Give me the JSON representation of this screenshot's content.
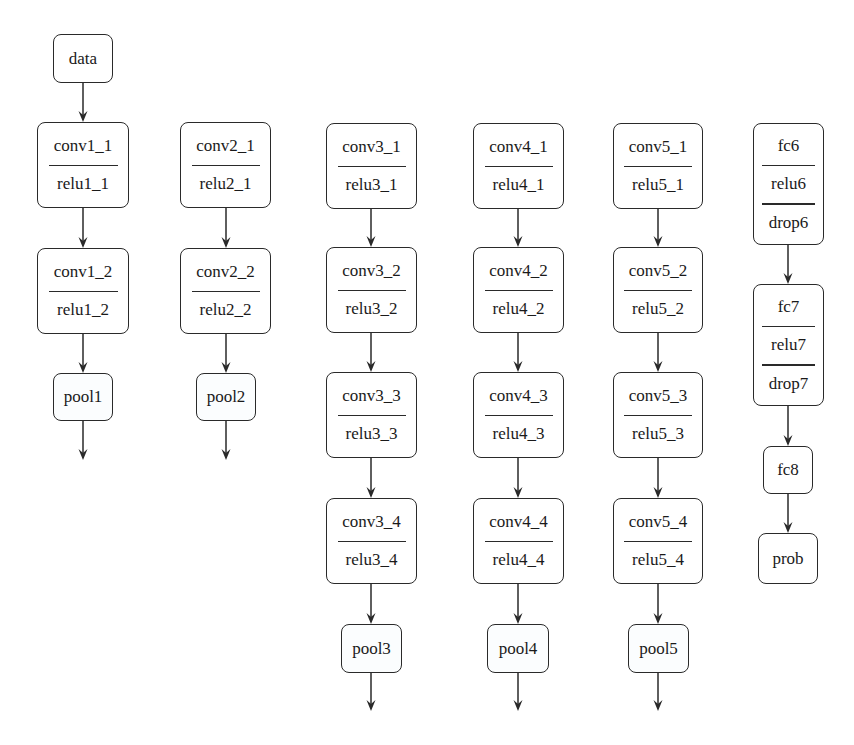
{
  "diagram": {
    "type": "network-architecture",
    "colors": {
      "stroke": "#2a2a2a",
      "background": "#ffffff",
      "text": "#1a1a1a"
    },
    "nodes": [
      {
        "id": "data",
        "parts": [
          "data"
        ],
        "box": [
          53,
          34,
          60,
          49
        ]
      },
      {
        "id": "conv1_1",
        "parts": [
          "conv1_1",
          "relu1_1"
        ],
        "box": [
          37,
          122,
          92,
          86
        ]
      },
      {
        "id": "conv1_2",
        "parts": [
          "conv1_2",
          "relu1_2"
        ],
        "box": [
          37,
          248,
          92,
          86
        ]
      },
      {
        "id": "pool1",
        "parts": [
          "pool1"
        ],
        "box": [
          53,
          373,
          60,
          48
        ],
        "pool": true
      },
      {
        "id": "conv2_1",
        "parts": [
          "conv2_1",
          "relu2_1"
        ],
        "box": [
          180,
          122,
          91,
          86
        ]
      },
      {
        "id": "conv2_2",
        "parts": [
          "conv2_2",
          "relu2_2"
        ],
        "box": [
          180,
          248,
          91,
          86
        ]
      },
      {
        "id": "pool2",
        "parts": [
          "pool2"
        ],
        "box": [
          196,
          373,
          60,
          48
        ],
        "pool": true
      },
      {
        "id": "conv3_1",
        "parts": [
          "conv3_1",
          "relu3_1"
        ],
        "box": [
          326,
          123,
          91,
          86
        ]
      },
      {
        "id": "conv3_2",
        "parts": [
          "conv3_2",
          "relu3_2"
        ],
        "box": [
          326,
          247,
          91,
          86
        ]
      },
      {
        "id": "conv3_3",
        "parts": [
          "conv3_3",
          "relu3_3"
        ],
        "box": [
          326,
          372,
          91,
          86
        ]
      },
      {
        "id": "conv3_4",
        "parts": [
          "conv3_4",
          "relu3_4"
        ],
        "box": [
          326,
          498,
          91,
          86
        ]
      },
      {
        "id": "pool3",
        "parts": [
          "pool3"
        ],
        "box": [
          341,
          624,
          61,
          49
        ],
        "pool": true
      },
      {
        "id": "conv4_1",
        "parts": [
          "conv4_1",
          "relu4_1"
        ],
        "box": [
          473,
          123,
          91,
          86
        ]
      },
      {
        "id": "conv4_2",
        "parts": [
          "conv4_2",
          "relu4_2"
        ],
        "box": [
          473,
          247,
          91,
          86
        ]
      },
      {
        "id": "conv4_3",
        "parts": [
          "conv4_3",
          "relu4_3"
        ],
        "box": [
          473,
          372,
          91,
          86
        ]
      },
      {
        "id": "conv4_4",
        "parts": [
          "conv4_4",
          "relu4_4"
        ],
        "box": [
          473,
          498,
          91,
          86
        ]
      },
      {
        "id": "pool4",
        "parts": [
          "pool4"
        ],
        "box": [
          487,
          624,
          62,
          49
        ],
        "pool": true
      },
      {
        "id": "conv5_1",
        "parts": [
          "conv5_1",
          "relu5_1"
        ],
        "box": [
          613,
          123,
          90,
          86
        ]
      },
      {
        "id": "conv5_2",
        "parts": [
          "conv5_2",
          "relu5_2"
        ],
        "box": [
          613,
          247,
          90,
          86
        ]
      },
      {
        "id": "conv5_3",
        "parts": [
          "conv5_3",
          "relu5_3"
        ],
        "box": [
          613,
          372,
          90,
          86
        ]
      },
      {
        "id": "conv5_4",
        "parts": [
          "conv5_4",
          "relu5_4"
        ],
        "box": [
          613,
          498,
          90,
          86
        ]
      },
      {
        "id": "pool5",
        "parts": [
          "pool5"
        ],
        "box": [
          628,
          624,
          61,
          49
        ],
        "pool": true
      },
      {
        "id": "fc6",
        "parts": [
          "fc6",
          "relu6",
          "drop6"
        ],
        "box": [
          753,
          123,
          71,
          122
        ]
      },
      {
        "id": "fc7",
        "parts": [
          "fc7",
          "relu7",
          "drop7"
        ],
        "box": [
          753,
          284,
          71,
          122
        ]
      },
      {
        "id": "fc8",
        "parts": [
          "fc8"
        ],
        "box": [
          763,
          446,
          50,
          48
        ]
      },
      {
        "id": "prob",
        "parts": [
          "prob"
        ],
        "box": [
          758,
          533,
          60,
          51
        ]
      }
    ],
    "edges": [
      {
        "x": 83,
        "y1": 83,
        "y2": 122
      },
      {
        "x": 83,
        "y1": 208,
        "y2": 248
      },
      {
        "x": 83,
        "y1": 334,
        "y2": 373
      },
      {
        "x": 83,
        "y1": 421,
        "y2": 460
      },
      {
        "x": 226,
        "y1": 208,
        "y2": 248
      },
      {
        "x": 226,
        "y1": 334,
        "y2": 373
      },
      {
        "x": 226,
        "y1": 421,
        "y2": 460
      },
      {
        "x": 371,
        "y1": 209,
        "y2": 247
      },
      {
        "x": 371,
        "y1": 333,
        "y2": 372
      },
      {
        "x": 371,
        "y1": 458,
        "y2": 498
      },
      {
        "x": 371,
        "y1": 584,
        "y2": 624
      },
      {
        "x": 371,
        "y1": 673,
        "y2": 711
      },
      {
        "x": 518,
        "y1": 209,
        "y2": 247
      },
      {
        "x": 518,
        "y1": 333,
        "y2": 372
      },
      {
        "x": 518,
        "y1": 458,
        "y2": 498
      },
      {
        "x": 518,
        "y1": 584,
        "y2": 624
      },
      {
        "x": 518,
        "y1": 673,
        "y2": 711
      },
      {
        "x": 658,
        "y1": 209,
        "y2": 247
      },
      {
        "x": 658,
        "y1": 333,
        "y2": 372
      },
      {
        "x": 658,
        "y1": 458,
        "y2": 498
      },
      {
        "x": 658,
        "y1": 584,
        "y2": 624
      },
      {
        "x": 658,
        "y1": 673,
        "y2": 711
      },
      {
        "x": 788,
        "y1": 245,
        "y2": 284
      },
      {
        "x": 788,
        "y1": 406,
        "y2": 446
      },
      {
        "x": 788,
        "y1": 494,
        "y2": 533
      }
    ]
  }
}
